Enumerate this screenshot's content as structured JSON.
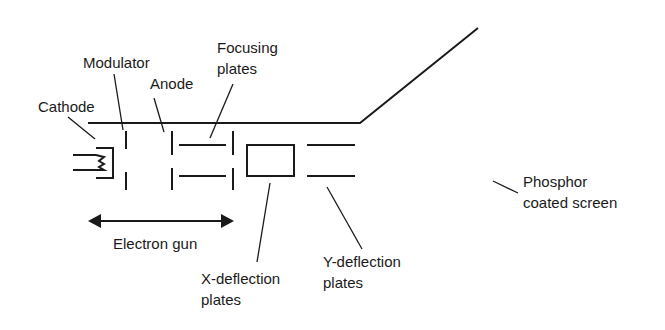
{
  "diagram": {
    "labels": {
      "cathode": "Cathode",
      "modulator": "Modulator",
      "anode": "Anode",
      "focusing_line1": "Focusing",
      "focusing_line2": "plates",
      "electron_gun": "Electron gun",
      "x_deflection_line1": "X-deflection",
      "x_deflection_line2": "plates",
      "y_deflection_line1": "Y-deflection",
      "y_deflection_line2": "plates",
      "screen_line1": "Phosphor",
      "screen_line2": "coated screen"
    },
    "colors": {
      "stroke": "#1a1a1a",
      "background": "#ffffff"
    }
  }
}
